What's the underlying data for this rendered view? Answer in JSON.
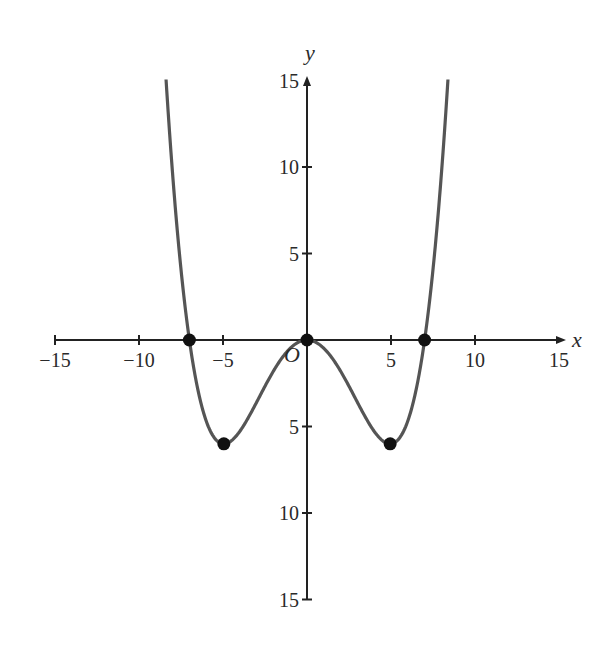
{
  "chart_data": {
    "type": "line",
    "title": "",
    "xlabel": "x",
    "ylabel": "y",
    "origin_label": "O",
    "xlim": [
      -15,
      15
    ],
    "ylim": [
      -15,
      15
    ],
    "grid": false,
    "legend": null,
    "x_ticks": [
      -15,
      -10,
      -5,
      5,
      10,
      15
    ],
    "x_tick_labels": [
      "−15",
      "−10",
      "−5",
      "5",
      "10",
      "15"
    ],
    "y_ticks": [
      15,
      10,
      5,
      -5,
      -10,
      -15
    ],
    "y_tick_labels": [
      "15",
      "10",
      "5",
      "5",
      "10",
      "15"
    ],
    "series": [
      {
        "name": "curve",
        "description": "quartic curve y = 0.01 x^2 (x^2 - 49)",
        "color": "#555555",
        "x": [
          -8.39,
          -8,
          -7.5,
          -7,
          -6.5,
          -6,
          -5.5,
          -4.95,
          -4.5,
          -4,
          -3.5,
          -3,
          -2.5,
          -2,
          -1.5,
          -1,
          -0.5,
          0,
          0.5,
          1,
          1.5,
          2,
          2.5,
          3,
          3.5,
          4,
          4.5,
          4.95,
          5.5,
          6,
          6.5,
          7,
          7.5,
          8,
          8.39
        ],
        "y": [
          15,
          9.6,
          4.22,
          0,
          -2.85,
          -4.68,
          -5.67,
          -6.0,
          -5.82,
          -5.28,
          -4.5,
          -3.6,
          -2.67,
          -1.8,
          -1.05,
          -0.48,
          -0.12,
          0,
          -0.12,
          -0.48,
          -1.05,
          -1.8,
          -2.67,
          -3.6,
          -4.5,
          -5.28,
          -5.82,
          -6.0,
          -5.67,
          -4.68,
          -2.85,
          0,
          4.22,
          9.6,
          15
        ]
      }
    ],
    "marked_points": [
      {
        "x": -7,
        "y": 0
      },
      {
        "x": -4.95,
        "y": -6
      },
      {
        "x": 0,
        "y": 0
      },
      {
        "x": 4.95,
        "y": -6
      },
      {
        "x": 7,
        "y": 0
      }
    ]
  },
  "colors": {
    "axis": "#222222",
    "curve": "#555555",
    "point": "#111111"
  }
}
